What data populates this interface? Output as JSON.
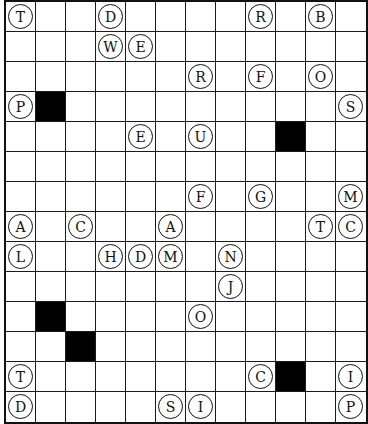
{
  "puzzle": {
    "type": "letter-grid",
    "cols": 12,
    "rows": 14,
    "colors": {
      "line": "#111111",
      "block": "#000000",
      "cell": "#ffffff"
    },
    "black_cells": [
      [
        1,
        3
      ],
      [
        9,
        4
      ],
      [
        1,
        10
      ],
      [
        2,
        11
      ],
      [
        9,
        12
      ]
    ],
    "letters": [
      {
        "col": 0,
        "row": 0,
        "letter": "T"
      },
      {
        "col": 3,
        "row": 0,
        "letter": "D"
      },
      {
        "col": 8,
        "row": 0,
        "letter": "R"
      },
      {
        "col": 10,
        "row": 0,
        "letter": "B"
      },
      {
        "col": 3,
        "row": 1,
        "letter": "W"
      },
      {
        "col": 4,
        "row": 1,
        "letter": "E"
      },
      {
        "col": 6,
        "row": 2,
        "letter": "R"
      },
      {
        "col": 8,
        "row": 2,
        "letter": "F"
      },
      {
        "col": 10,
        "row": 2,
        "letter": "O"
      },
      {
        "col": 0,
        "row": 3,
        "letter": "P"
      },
      {
        "col": 11,
        "row": 3,
        "letter": "S"
      },
      {
        "col": 4,
        "row": 4,
        "letter": "E"
      },
      {
        "col": 6,
        "row": 4,
        "letter": "U"
      },
      {
        "col": 6,
        "row": 6,
        "letter": "F"
      },
      {
        "col": 8,
        "row": 6,
        "letter": "G"
      },
      {
        "col": 11,
        "row": 6,
        "letter": "M"
      },
      {
        "col": 0,
        "row": 7,
        "letter": "A"
      },
      {
        "col": 2,
        "row": 7,
        "letter": "C"
      },
      {
        "col": 5,
        "row": 7,
        "letter": "A"
      },
      {
        "col": 10,
        "row": 7,
        "letter": "T"
      },
      {
        "col": 11,
        "row": 7,
        "letter": "C"
      },
      {
        "col": 0,
        "row": 8,
        "letter": "L"
      },
      {
        "col": 3,
        "row": 8,
        "letter": "H"
      },
      {
        "col": 4,
        "row": 8,
        "letter": "D"
      },
      {
        "col": 5,
        "row": 8,
        "letter": "M"
      },
      {
        "col": 7,
        "row": 8,
        "letter": "N"
      },
      {
        "col": 7,
        "row": 9,
        "letter": "J"
      },
      {
        "col": 6,
        "row": 10,
        "letter": "O"
      },
      {
        "col": 0,
        "row": 12,
        "letter": "T"
      },
      {
        "col": 8,
        "row": 12,
        "letter": "C"
      },
      {
        "col": 11,
        "row": 12,
        "letter": "I"
      },
      {
        "col": 0,
        "row": 13,
        "letter": "D"
      },
      {
        "col": 5,
        "row": 13,
        "letter": "S"
      },
      {
        "col": 6,
        "row": 13,
        "letter": "I"
      },
      {
        "col": 11,
        "row": 13,
        "letter": "P"
      }
    ]
  }
}
